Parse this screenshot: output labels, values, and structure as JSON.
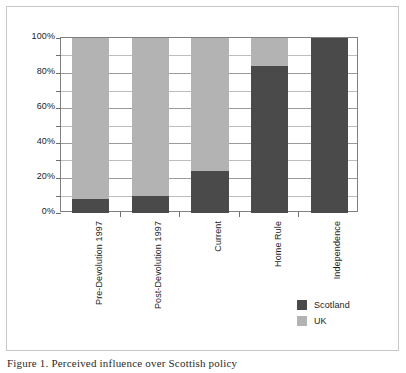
{
  "figure": {
    "caption": "Figure 1.  Perceived influence over Scottish policy"
  },
  "legend": {
    "position": "bottom-right-inside",
    "items": [
      {
        "label": "Scotland",
        "color": "#4a4a4a",
        "swatch_name": "legend-swatch-scotland"
      },
      {
        "label": "UK",
        "color": "#b3b3b3",
        "swatch_name": "legend-swatch-uk"
      }
    ]
  },
  "axis": {
    "y_tick_labels": [
      "100%",
      "80%",
      "60%",
      "40%",
      "20%",
      "0%"
    ],
    "y_minor_step_percent": 10
  },
  "chart_data": {
    "type": "bar",
    "stacked": true,
    "normalized_percent": true,
    "title": "",
    "subtitle": "",
    "xlabel": "",
    "ylabel": "",
    "ylim": [
      0,
      100
    ],
    "yticks": [
      0,
      20,
      40,
      60,
      80,
      100
    ],
    "ytick_labels": [
      "0%",
      "20%",
      "40%",
      "60%",
      "80%",
      "100%"
    ],
    "grid": true,
    "grid_minor_step": 10,
    "legend_position": "lower right",
    "categories": [
      "Pre-Devolution 1997",
      "Post-Devolution 1997",
      "Current",
      "Home Rule",
      "Independence"
    ],
    "series": [
      {
        "name": "Scotland",
        "color": "#4a4a4a",
        "values": [
          8,
          10,
          24,
          84,
          100
        ]
      },
      {
        "name": "UK",
        "color": "#b3b3b3",
        "values": [
          92,
          90,
          76,
          16,
          0
        ]
      }
    ]
  }
}
